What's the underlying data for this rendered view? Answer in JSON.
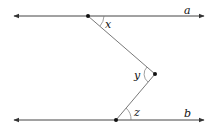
{
  "diagram": {
    "lines": [
      {
        "name": "a",
        "label": "a",
        "y": 16
      },
      {
        "name": "b",
        "label": "b",
        "y": 120
      }
    ],
    "points": [
      {
        "name": "top-vertex",
        "x": 88,
        "y": 16
      },
      {
        "name": "middle-vertex",
        "x": 155,
        "y": 74
      },
      {
        "name": "bottom-vertex",
        "x": 116,
        "y": 120
      }
    ],
    "angles": [
      {
        "label": "x"
      },
      {
        "label": "y"
      },
      {
        "label": "z"
      }
    ],
    "colors": {
      "line": "#444444",
      "arc": "#777777",
      "point": "#111111"
    }
  }
}
